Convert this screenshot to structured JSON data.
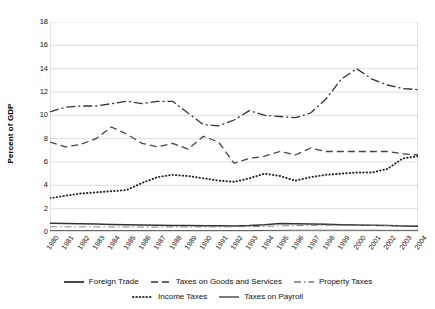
{
  "chart_data": {
    "type": "line",
    "title": "",
    "xlabel": "",
    "ylabel": "Percent of GDP",
    "ylim": [
      0,
      18
    ],
    "ytick_step": 2,
    "yticks": [
      0,
      2,
      4,
      6,
      8,
      10,
      12,
      14,
      16,
      18
    ],
    "grid": true,
    "legend_position": "bottom",
    "categories": [
      "1980",
      "1981",
      "1982",
      "1983",
      "1984",
      "1985",
      "1986",
      "1987",
      "1988",
      "1989",
      "1990",
      "1991",
      "1992",
      "1993",
      "1994",
      "1995",
      "1996",
      "1997",
      "1998",
      "1999",
      "2000",
      "2001",
      "2002",
      "2003",
      "2004"
    ],
    "series": [
      {
        "name": "Foreign Trade",
        "style": "solid",
        "color": "#333333",
        "values": [
          0.75,
          0.72,
          0.7,
          0.68,
          0.65,
          0.62,
          0.6,
          0.58,
          0.56,
          0.55,
          0.54,
          0.53,
          0.52,
          0.55,
          0.62,
          0.72,
          0.7,
          0.68,
          0.66,
          0.63,
          0.6,
          0.58,
          0.55,
          0.52,
          0.5
        ]
      },
      {
        "name": "Taxes on Goods and Services",
        "style": "dashed",
        "color": "#444444",
        "values": [
          7.7,
          7.3,
          7.5,
          8.0,
          9.0,
          8.4,
          7.6,
          7.3,
          7.6,
          7.1,
          8.2,
          7.7,
          5.9,
          6.3,
          6.5,
          6.9,
          6.6,
          7.2,
          6.9,
          6.9,
          6.9,
          6.9,
          6.9,
          6.7,
          6.6
        ]
      },
      {
        "name": "Property Taxes",
        "style": "dashdot-thin",
        "color": "#777777",
        "values": [
          0.45,
          0.45,
          0.44,
          0.44,
          0.43,
          0.43,
          0.42,
          0.42,
          0.43,
          0.43,
          0.44,
          0.44,
          0.45,
          0.46,
          0.48,
          0.52,
          0.55,
          0.57,
          0.58,
          0.58,
          0.58,
          0.57,
          0.56,
          0.55,
          0.55
        ]
      },
      {
        "name": "Income Taxes",
        "style": "dotted",
        "color": "#222222",
        "values": [
          2.9,
          3.1,
          3.3,
          3.4,
          3.5,
          3.6,
          4.2,
          4.7,
          4.9,
          4.8,
          4.6,
          4.4,
          4.3,
          4.6,
          5.0,
          4.8,
          4.4,
          4.7,
          4.9,
          5.0,
          5.1,
          5.1,
          5.4,
          6.3,
          6.5
        ]
      },
      {
        "name": "Taxes on Payroll",
        "style": "solid-thin",
        "color": "#555555",
        "values": [
          0.12,
          0.12,
          0.12,
          0.12,
          0.12,
          0.12,
          0.12,
          0.12,
          0.12,
          0.12,
          0.12,
          0.12,
          0.12,
          0.12,
          0.13,
          0.14,
          0.15,
          0.15,
          0.15,
          0.15,
          0.15,
          0.15,
          0.14,
          0.14,
          0.14
        ]
      }
    ],
    "top_series_note": "Taxes on Goods and Services upper dash-dot band",
    "upper_band": {
      "name": "Taxes on Goods and Services",
      "values": [
        10.3,
        10.7,
        10.8,
        10.8,
        11.0,
        11.2,
        11.0,
        11.2,
        11.2,
        10.2,
        9.2,
        9.1,
        9.6,
        10.4,
        10.0,
        9.9,
        9.8,
        10.2,
        11.4,
        13.1,
        14.0,
        13.1,
        12.6,
        12.3,
        12.2
      ]
    }
  },
  "legend": {
    "rows": [
      [
        {
          "label": "Foreign Trade",
          "style": "solid"
        },
        {
          "label": "Taxes on Goods and Services",
          "style": "dashed"
        },
        {
          "label": "Property Taxes",
          "style": "dashdot-thin"
        }
      ],
      [
        {
          "label": "Income Taxes",
          "style": "dotted"
        },
        {
          "label": "Taxes on Payroll",
          "style": "solid-thin"
        }
      ]
    ]
  },
  "axis": {
    "y_title": "Percent of GDP"
  }
}
